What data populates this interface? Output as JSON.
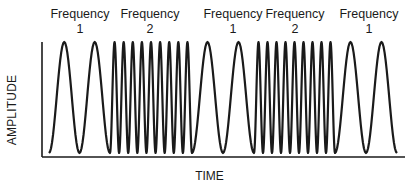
{
  "diagram": {
    "title": "",
    "segment_labels": [
      {
        "word": "Frequency",
        "number": "1",
        "center_x": 80
      },
      {
        "word": "Frequency",
        "number": "2",
        "center_x": 150
      },
      {
        "word": "Frequency",
        "number": "1",
        "center_x": 233
      },
      {
        "word": "Frequency",
        "number": "2",
        "center_x": 295
      },
      {
        "word": "Frequency",
        "number": "1",
        "center_x": 369
      }
    ],
    "y_axis_label": "AMPLITUDE",
    "x_axis_label": "TIME",
    "axes": {
      "origin_x": 42,
      "origin_y": 157,
      "y_top": 42,
      "x_right": 405
    },
    "waveform": {
      "top_y": 42,
      "bottom_y": 153,
      "stroke_color": "#1a1a1a",
      "segments": [
        {
          "frequency": 1,
          "start_x": 49,
          "end_x": 110,
          "cycles": 2
        },
        {
          "frequency": 2,
          "start_x": 110,
          "end_x": 192,
          "cycles": 9
        },
        {
          "frequency": 1,
          "start_x": 192,
          "end_x": 254,
          "cycles": 2
        },
        {
          "frequency": 2,
          "start_x": 254,
          "end_x": 335,
          "cycles": 9
        },
        {
          "frequency": 1,
          "start_x": 335,
          "end_x": 397,
          "cycles": 2
        }
      ]
    }
  }
}
